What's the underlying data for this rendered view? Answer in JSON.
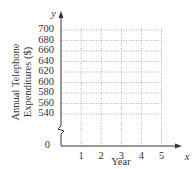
{
  "chart_data": {
    "type": "line",
    "title": "",
    "xlabel": "Year",
    "ylabel": "Annual Telephone Expenditures ($)",
    "ylabel_lines": [
      "Annual Telephone",
      "Expenditures ($)"
    ],
    "x_axis_var": "x",
    "y_axis_var": "y",
    "x_ticks": [
      "1",
      "2",
      "3",
      "4",
      "5"
    ],
    "y_ticks": [
      "700",
      "680",
      "660",
      "640",
      "620",
      "600",
      "580",
      "560",
      "540"
    ],
    "y_origin_label": "0",
    "xlim": [
      0,
      5.6
    ],
    "ylim": [
      540,
      700
    ],
    "y_axis_break": true,
    "grid": "dotted",
    "series": [],
    "legend": null
  }
}
